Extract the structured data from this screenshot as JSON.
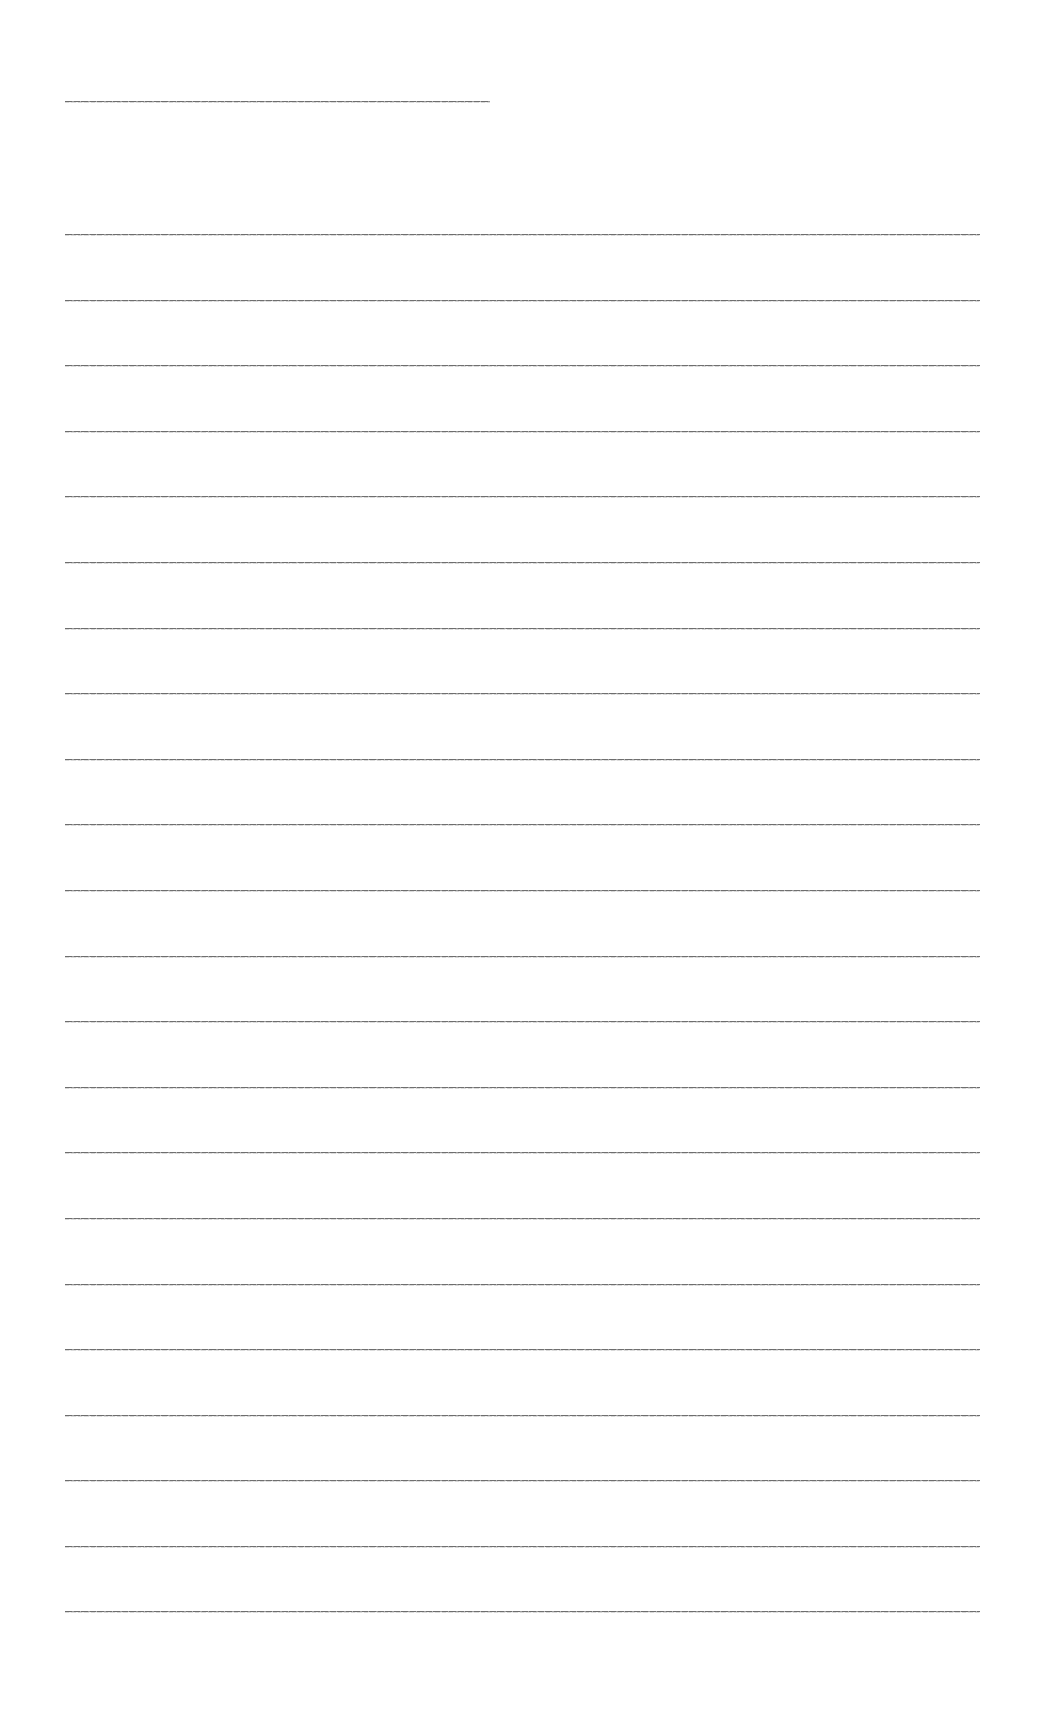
{
  "document": {
    "heading": {
      "text": "[illegible heading text]"
    },
    "lines": [
      {
        "text": "[illegible line 1]"
      },
      {
        "text": "[illegible line 2]"
      },
      {
        "text": "[illegible line 3]"
      },
      {
        "text": "[illegible line 4]"
      },
      {
        "text": "[illegible line 5]"
      },
      {
        "text": "[illegible line 6]"
      },
      {
        "text": "[illegible line 7]"
      },
      {
        "text": "[illegible line 8]"
      },
      {
        "text": "[illegible line 9]"
      },
      {
        "text": "[illegible line 10]"
      },
      {
        "text": "[illegible line 11]"
      },
      {
        "text": "[illegible line 12]"
      },
      {
        "text": "[illegible line 13]"
      },
      {
        "text": "[illegible line 14]"
      },
      {
        "text": "[illegible line 15]"
      },
      {
        "text": "[illegible line 16]"
      },
      {
        "text": "[illegible line 17]"
      },
      {
        "text": "[illegible line 18]"
      },
      {
        "text": "[illegible line 19]"
      },
      {
        "text": "[illegible line 20]"
      },
      {
        "text": "[illegible line 21]"
      },
      {
        "text": "[illegible line 22]"
      }
    ]
  },
  "colors": {
    "background": "#ffffff",
    "text_stroke": "#6e6e6e"
  }
}
